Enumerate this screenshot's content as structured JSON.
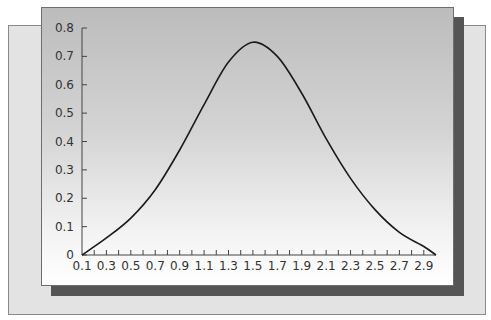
{
  "chart_data": {
    "type": "line",
    "title": "",
    "xlabel": "",
    "ylabel": "",
    "x_tick_labels": [
      "0.1",
      "0.3",
      "0.5",
      "0.7",
      "0.9",
      "1.1",
      "1.3",
      "1.5",
      "1.7",
      "1.9",
      "2.1",
      "2.3",
      "2.5",
      "2.7",
      "2.9"
    ],
    "y_tick_labels": [
      "0",
      "0.1",
      "0.2",
      "0.3",
      "0.4",
      "0.5",
      "0.6",
      "0.7",
      "0.8"
    ],
    "xlim": [
      0.1,
      3.0
    ],
    "ylim": [
      0,
      0.8
    ],
    "grid": false,
    "legend": null,
    "series": [
      {
        "name": "bell curve",
        "color": "#1a1a1a",
        "x": [
          0.1,
          0.3,
          0.5,
          0.7,
          0.9,
          1.1,
          1.3,
          1.5,
          1.7,
          1.9,
          2.1,
          2.3,
          2.5,
          2.7,
          2.9,
          3.0
        ],
        "y": [
          0.0,
          0.06,
          0.13,
          0.23,
          0.37,
          0.53,
          0.68,
          0.75,
          0.7,
          0.57,
          0.41,
          0.27,
          0.16,
          0.08,
          0.03,
          0.0
        ]
      }
    ]
  },
  "colors": {
    "outer_panel": "#e3e3e3",
    "shadow": "#555555",
    "plot_gradient_top": "#bcbcbc",
    "plot_gradient_bottom": "#ffffff",
    "line": "#1a1a1a"
  }
}
